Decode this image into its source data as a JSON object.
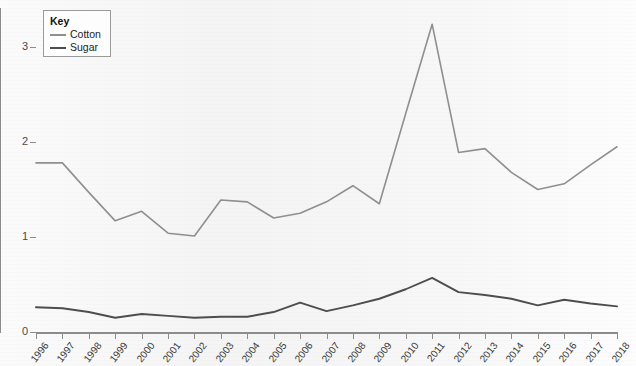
{
  "chart_data": {
    "type": "line",
    "title": "",
    "xlabel": "",
    "ylabel": "Price (US$ per kg)",
    "ylim": [
      0,
      3.4
    ],
    "yticks": [
      0,
      1,
      2,
      3
    ],
    "ytick_labels": [
      "0",
      "1",
      "2",
      "3"
    ],
    "grid": false,
    "legend_position": "top-left",
    "legend_title": "Key",
    "categories": [
      "1996",
      "1997",
      "1998",
      "1999",
      "2000",
      "2001",
      "2002",
      "2003",
      "2004",
      "2005",
      "2006",
      "2007",
      "2008",
      "2009",
      "2010",
      "2011",
      "2012",
      "2013",
      "2014",
      "2015",
      "2016",
      "2017",
      "2018"
    ],
    "series": [
      {
        "name": "Cotton",
        "color": "#8f8f8f",
        "values": [
          1.78,
          1.78,
          1.47,
          1.17,
          1.27,
          1.04,
          1.01,
          1.39,
          1.37,
          1.2,
          1.25,
          1.37,
          1.54,
          1.35,
          2.3,
          3.24,
          1.89,
          1.93,
          1.68,
          1.5,
          1.56,
          1.76,
          1.95
        ]
      },
      {
        "name": "Sugar",
        "color": "#4d4d4d",
        "values": [
          0.26,
          0.25,
          0.21,
          0.15,
          0.19,
          0.17,
          0.15,
          0.16,
          0.16,
          0.21,
          0.31,
          0.22,
          0.28,
          0.35,
          0.45,
          0.57,
          0.42,
          0.39,
          0.35,
          0.28,
          0.34,
          0.3,
          0.27
        ]
      }
    ]
  }
}
